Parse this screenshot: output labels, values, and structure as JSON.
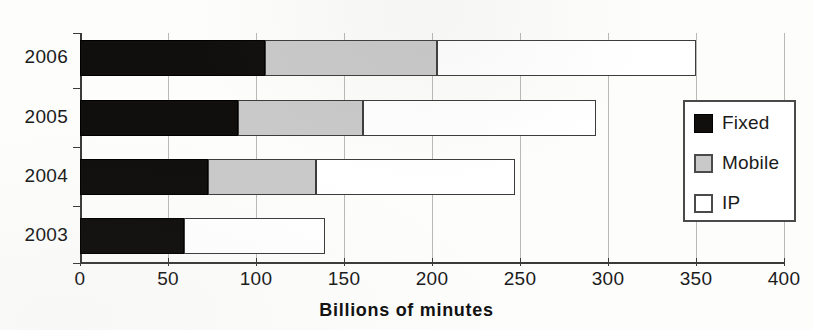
{
  "chart_data": {
    "type": "bar",
    "orientation": "horizontal",
    "stacked": true,
    "title": "",
    "xlabel": "Billions of minutes",
    "ylabel": "",
    "xlim": [
      0,
      400
    ],
    "xticks": [
      "0",
      "50",
      "100",
      "150",
      "200",
      "250",
      "300",
      "350",
      "400"
    ],
    "xtick_values": [
      0,
      50,
      100,
      150,
      200,
      250,
      300,
      350,
      400
    ],
    "grid": "vertical",
    "categories": [
      "2006",
      "2005",
      "2004",
      "2003"
    ],
    "series": [
      {
        "name": "Fixed",
        "color": "#100f0d",
        "values": [
          105,
          90,
          73,
          59
        ]
      },
      {
        "name": "Mobile",
        "color": "#c9c9c9",
        "values": [
          98,
          71,
          61,
          0
        ]
      },
      {
        "name": "IP",
        "color": "#ffffff",
        "values": [
          147,
          132,
          113,
          80
        ]
      }
    ],
    "cumulative_totals": [
      350,
      293,
      247,
      139
    ],
    "legend": {
      "position": "right-middle",
      "entries": [
        {
          "label": "Fixed",
          "swatch": "black-square"
        },
        {
          "label": "Mobile",
          "swatch": "gray-square"
        },
        {
          "label": "IP",
          "swatch": "white-square"
        }
      ]
    }
  }
}
